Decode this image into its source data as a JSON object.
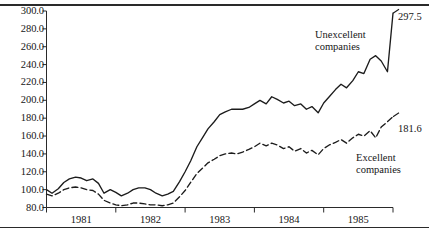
{
  "chart_data": {
    "type": "line",
    "title": "",
    "subtitle": "",
    "xlabel": "",
    "ylabel": "",
    "xlim": [
      1981.0,
      1986.0
    ],
    "ylim": [
      80.0,
      300.0
    ],
    "grid": false,
    "legend_position": "inline-annotation",
    "y_ticks": [
      "80.0",
      "100.0",
      "120.0",
      "140.0",
      "160.0",
      "180.0",
      "200.0",
      "220.0",
      "240.0",
      "260.0",
      "280.0",
      "300.0"
    ],
    "y_tick_values": [
      80,
      100,
      120,
      140,
      160,
      180,
      200,
      220,
      240,
      260,
      280,
      300
    ],
    "x_ticks": [
      "1981",
      "1982",
      "1983",
      "1984",
      "1985"
    ],
    "x_tick_values": [
      1981,
      1982,
      1983,
      1984,
      1985
    ],
    "series": [
      {
        "name": "Unexcellent companies",
        "style": "solid",
        "color": "#1c1c1c",
        "end_label": "297.5",
        "end_value": 297.5,
        "x": [
          1981.0,
          1981.08,
          1981.17,
          1981.25,
          1981.33,
          1981.42,
          1981.5,
          1981.58,
          1981.67,
          1981.75,
          1981.83,
          1981.92,
          1982.0,
          1982.08,
          1982.17,
          1982.25,
          1982.33,
          1982.42,
          1982.5,
          1982.58,
          1982.67,
          1982.75,
          1982.83,
          1982.92,
          1983.0,
          1983.08,
          1983.17,
          1983.25,
          1983.33,
          1983.42,
          1983.5,
          1983.58,
          1983.67,
          1983.75,
          1983.83,
          1983.92,
          1984.0,
          1984.08,
          1984.17,
          1984.25,
          1984.33,
          1984.42,
          1984.5,
          1984.58,
          1984.67,
          1984.75,
          1984.83,
          1984.92,
          1985.0,
          1985.08,
          1985.17,
          1985.25,
          1985.33,
          1985.42,
          1985.5,
          1985.58,
          1985.67,
          1985.75,
          1985.83,
          1985.92,
          1986.0
        ],
        "values": [
          100.0,
          96.0,
          101.0,
          108.0,
          112.0,
          114.0,
          113.0,
          110.0,
          112.0,
          107.0,
          96.0,
          100.0,
          97.0,
          93.0,
          96.0,
          100.0,
          102.0,
          102.0,
          100.0,
          96.0,
          93.0,
          95.0,
          98.0,
          109.0,
          120.0,
          132.0,
          148.0,
          158.0,
          168.0,
          176.0,
          184.0,
          187.0,
          190.0,
          190.0,
          190.0,
          192.0,
          196.0,
          200.0,
          196.0,
          204.0,
          201.0,
          197.0,
          199.0,
          194.0,
          196.0,
          190.0,
          193.0,
          186.0,
          197.0,
          204.0,
          212.0,
          218.0,
          214.0,
          222.0,
          232.0,
          230.0,
          246.0,
          250.0,
          244.0,
          232.0,
          297.5
        ]
      },
      {
        "name": "Excellent companies",
        "style": "dashed",
        "color": "#1c1c1c",
        "end_label": "181.6",
        "end_value": 181.6,
        "x": [
          1981.0,
          1981.08,
          1981.17,
          1981.25,
          1981.33,
          1981.42,
          1981.5,
          1981.58,
          1981.67,
          1981.75,
          1981.83,
          1981.92,
          1982.0,
          1982.08,
          1982.17,
          1982.25,
          1982.33,
          1982.42,
          1982.5,
          1982.58,
          1982.67,
          1982.75,
          1982.83,
          1982.92,
          1983.0,
          1983.08,
          1983.17,
          1983.25,
          1983.33,
          1983.42,
          1983.5,
          1983.58,
          1983.67,
          1983.75,
          1983.83,
          1983.92,
          1984.0,
          1984.08,
          1984.17,
          1984.25,
          1984.33,
          1984.42,
          1984.5,
          1984.58,
          1984.67,
          1984.75,
          1984.83,
          1984.92,
          1985.0,
          1985.08,
          1985.17,
          1985.25,
          1985.33,
          1985.42,
          1985.5,
          1985.58,
          1985.67,
          1985.75,
          1985.83,
          1985.92,
          1986.0
        ],
        "values": [
          95.0,
          93.0,
          96.0,
          100.0,
          102.0,
          103.0,
          102.0,
          100.0,
          99.0,
          95.0,
          88.0,
          85.0,
          83.0,
          82.0,
          83.0,
          85.0,
          85.0,
          84.0,
          83.0,
          83.0,
          82.0,
          83.0,
          85.0,
          92.0,
          99.0,
          108.0,
          118.0,
          124.0,
          130.0,
          134.0,
          138.0,
          140.0,
          141.0,
          140.0,
          142.0,
          145.0,
          148.0,
          152.0,
          149.0,
          152.0,
          150.0,
          146.0,
          148.0,
          143.0,
          146.0,
          141.0,
          144.0,
          139.0,
          146.0,
          150.0,
          153.0,
          156.0,
          152.0,
          158.0,
          162.0,
          160.0,
          166.0,
          158.0,
          170.0,
          176.0,
          181.6
        ]
      }
    ],
    "annotations": [
      {
        "text_line1": "Unexcellent",
        "text_line2": "companies"
      },
      {
        "text_line1": "Excellent",
        "text_line2": "companies"
      }
    ]
  },
  "axes": {
    "y_labels": [
      "300.0",
      "280.0",
      "260.0",
      "240.0",
      "220.0",
      "200.0",
      "180.0",
      "160.0",
      "140.0",
      "120.0",
      "100.0",
      "80.0"
    ],
    "x_labels": [
      "1981",
      "1982",
      "1983",
      "1984",
      "1985"
    ]
  },
  "labels": {
    "unexcellent_line1": "Unexcellent",
    "unexcellent_line2": "companies",
    "excellent_line1": "Excellent",
    "excellent_line2": "companies",
    "end_unexcellent": "297.5",
    "end_excellent": "181.6"
  },
  "colors": {
    "ink": "#1c1c1c",
    "axis": "#2a2a2a",
    "background": "#ffffff"
  }
}
